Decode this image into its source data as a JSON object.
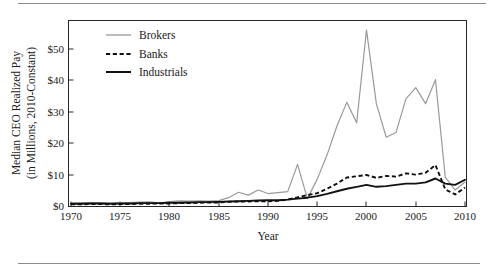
{
  "figure": {
    "has_top_rule": true,
    "has_bottom_rule": true,
    "rule_color": "#8d8d8d"
  },
  "chart_data": {
    "type": "line",
    "title": "",
    "xlabel": "Year",
    "ylabel": "Median CEO Realized Pay\n(in Millions, 2010-Constant)",
    "ylabel_line1": "Median CEO Realized Pay",
    "ylabel_line2": "(in Millions, 2010-Constant)",
    "xlim": [
      1970,
      2010
    ],
    "ylim": [
      0,
      58
    ],
    "grid": false,
    "legend_position": "top-left inside axes",
    "xticks": [
      1970,
      1975,
      1980,
      1985,
      1990,
      1995,
      2000,
      2005,
      2010
    ],
    "xtick_labels": [
      "1970",
      "1975",
      "1980",
      "1985",
      "1990",
      "1995",
      "2000",
      "2005",
      "2010"
    ],
    "yticks": [
      0,
      10,
      20,
      30,
      40,
      50
    ],
    "ytick_labels": [
      "$0",
      "$10",
      "$20",
      "$30",
      "$40",
      "$50"
    ],
    "x": [
      1970,
      1971,
      1972,
      1973,
      1974,
      1975,
      1976,
      1977,
      1978,
      1979,
      1980,
      1981,
      1982,
      1983,
      1984,
      1985,
      1986,
      1987,
      1988,
      1989,
      1990,
      1991,
      1992,
      1993,
      1994,
      1995,
      1996,
      1997,
      1998,
      1999,
      2000,
      2001,
      2002,
      2003,
      2004,
      2005,
      2006,
      2007,
      2008,
      2009,
      2010
    ],
    "series": [
      {
        "name": "Brokers",
        "color": "#9a9a9a",
        "style": "solid",
        "values": [
          0.9,
          1.0,
          1.1,
          1.0,
          0.9,
          1.0,
          1.1,
          1.2,
          1.3,
          0.9,
          1.4,
          1.6,
          1.5,
          1.6,
          1.5,
          1.7,
          2.6,
          4.3,
          3.4,
          5.0,
          3.9,
          4.2,
          4.5,
          13.0,
          2.3,
          8.4,
          16.0,
          25.0,
          32.4,
          26.0,
          55.0,
          32.0,
          21.5,
          23.0,
          33.5,
          37.0,
          32.0,
          39.5,
          9.0,
          5.0,
          7.5
        ]
      },
      {
        "name": "Banks",
        "color": "#111111",
        "style": "dashed",
        "values": [
          0.5,
          0.5,
          0.6,
          0.6,
          0.5,
          0.6,
          0.6,
          0.7,
          0.7,
          0.8,
          0.8,
          0.9,
          0.9,
          1.0,
          1.1,
          1.1,
          1.3,
          1.4,
          1.4,
          1.5,
          1.5,
          1.6,
          2.0,
          2.7,
          3.4,
          4.0,
          5.4,
          7.0,
          8.9,
          9.3,
          9.7,
          8.8,
          9.4,
          9.2,
          10.2,
          9.8,
          10.4,
          12.8,
          5.2,
          3.6,
          5.8
        ]
      },
      {
        "name": "Industrials",
        "color": "#111111",
        "style": "solid",
        "values": [
          0.7,
          0.7,
          0.8,
          0.8,
          0.7,
          0.8,
          0.8,
          0.9,
          0.9,
          0.9,
          1.0,
          1.0,
          1.1,
          1.2,
          1.2,
          1.3,
          1.4,
          1.5,
          1.6,
          1.7,
          1.8,
          1.8,
          2.0,
          2.3,
          2.6,
          3.1,
          3.8,
          4.6,
          5.4,
          6.0,
          6.6,
          6.0,
          6.2,
          6.6,
          7.0,
          7.0,
          7.4,
          8.6,
          7.0,
          6.6,
          8.2
        ]
      }
    ],
    "legend": [
      {
        "label": "Brokers",
        "swatch": "solid-gray-line"
      },
      {
        "label": "Banks",
        "swatch": "dashed-black-line"
      },
      {
        "label": "Industrials",
        "swatch": "solid-black-line"
      }
    ]
  }
}
